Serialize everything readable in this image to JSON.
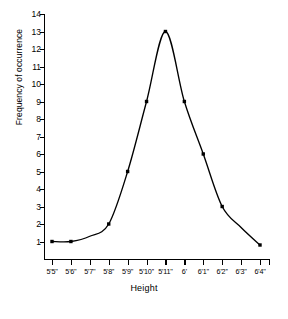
{
  "chart_data": {
    "type": "line",
    "title": "",
    "xlabel": "Height",
    "ylabel": "Frequency of occurrence",
    "grid": false,
    "legend": "none",
    "marker": "filled-square",
    "line_color": "#000000",
    "marker_color": "#000000",
    "background": "#ffffff",
    "ylim": [
      0,
      14
    ],
    "yticks": [
      1,
      2,
      3,
      4,
      5,
      6,
      7,
      8,
      9,
      10,
      11,
      12,
      13,
      14
    ],
    "ytick_labels": [
      "1",
      "2",
      "3",
      "4",
      "5",
      "6",
      "7",
      "8",
      "9",
      "10",
      "11",
      "12",
      "13",
      "14"
    ],
    "categories": [
      "5'5''",
      "5'6''",
      "5'7''",
      "5'8''",
      "5'9''",
      "5'10''",
      "5'11''",
      "6'",
      "6'1''",
      "6'2''",
      "6'3''",
      "6'4''"
    ],
    "values": [
      1,
      1,
      1.3,
      2,
      5,
      9,
      13,
      9,
      6,
      3,
      1.8,
      0.8
    ],
    "markers_shown": [
      true,
      true,
      false,
      true,
      true,
      true,
      true,
      true,
      true,
      true,
      false,
      true
    ],
    "series": [
      {
        "name": "Frequency of occurrence",
        "points": [
          {
            "x": "5'5''",
            "y": 1
          },
          {
            "x": "5'6''",
            "y": 1
          },
          {
            "x": "5'7''",
            "y": 1.3
          },
          {
            "x": "5'8''",
            "y": 2
          },
          {
            "x": "5'9''",
            "y": 5
          },
          {
            "x": "5'10''",
            "y": 9
          },
          {
            "x": "5'11''",
            "y": 13
          },
          {
            "x": "6'",
            "y": 9
          },
          {
            "x": "6'1''",
            "y": 6
          },
          {
            "x": "6'2''",
            "y": 3
          },
          {
            "x": "6'3''",
            "y": 1.8
          },
          {
            "x": "6'4''",
            "y": 0.8
          }
        ]
      }
    ]
  },
  "caption": {
    "text": ""
  }
}
